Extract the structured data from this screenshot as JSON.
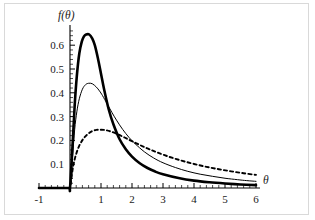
{
  "figure": {
    "background_color": "#ffffff",
    "border_color": "#d9d9d9",
    "axis_color": "#000000"
  },
  "axis_titles": {
    "y": "f(θ)",
    "x": "θ"
  },
  "chart_data": {
    "type": "line",
    "title": "",
    "subtitle": "",
    "xlabel": "θ",
    "ylabel": "f(θ)",
    "xlim": [
      -1,
      6
    ],
    "ylim": [
      0,
      0.66
    ],
    "grid": false,
    "legend": "none",
    "x_ticks": [
      -1,
      0,
      1,
      2,
      3,
      4,
      5,
      6
    ],
    "x_tick_labels": [
      "-1",
      "",
      "1",
      "2",
      "3",
      "4",
      "5",
      "6"
    ],
    "x_minor_tick_step": 0.2,
    "y_ticks": [
      0.1,
      0.2,
      0.3,
      0.4,
      0.5,
      0.6
    ],
    "y_tick_labels": [
      "0.1",
      "0.2",
      "0.3",
      "0.4",
      "0.5",
      "0.6"
    ],
    "y_minor_tick_step": 0.02,
    "annotations": [],
    "series": [
      {
        "name": "thick-solid-curve",
        "style": "solid",
        "line_width": 2.6,
        "color": "#000000",
        "peak": {
          "x": 0.62,
          "y": 0.645
        },
        "x": [
          -1.0,
          -0.5,
          -0.05,
          0.0,
          0.08,
          0.15,
          0.22,
          0.3,
          0.38,
          0.45,
          0.52,
          0.62,
          0.72,
          0.8,
          0.9,
          1.0,
          1.1,
          1.25,
          1.4,
          1.6,
          1.8,
          2.0,
          2.25,
          2.5,
          2.75,
          3.0,
          3.5,
          4.0,
          4.5,
          5.0,
          5.5,
          6.0
        ],
        "y": [
          0.0,
          0.0,
          0.0,
          0.0,
          0.175,
          0.345,
          0.47,
          0.565,
          0.615,
          0.637,
          0.645,
          0.645,
          0.628,
          0.6,
          0.545,
          0.48,
          0.415,
          0.33,
          0.268,
          0.205,
          0.163,
          0.132,
          0.104,
          0.084,
          0.069,
          0.058,
          0.042,
          0.031,
          0.024,
          0.019,
          0.015,
          0.012
        ]
      },
      {
        "name": "thin-solid-curve",
        "style": "solid",
        "line_width": 1.0,
        "color": "#000000",
        "peak": {
          "x": 0.72,
          "y": 0.44
        },
        "x": [
          -1.0,
          -0.5,
          -0.05,
          0.0,
          0.08,
          0.15,
          0.22,
          0.3,
          0.4,
          0.5,
          0.6,
          0.72,
          0.85,
          0.95,
          1.05,
          1.2,
          1.35,
          1.5,
          1.7,
          1.9,
          2.1,
          2.4,
          2.7,
          3.0,
          3.4,
          3.8,
          4.2,
          4.6,
          5.0,
          5.4,
          5.7,
          6.0
        ],
        "y": [
          0.0,
          0.0,
          0.0,
          0.0,
          0.128,
          0.245,
          0.32,
          0.375,
          0.415,
          0.434,
          0.44,
          0.438,
          0.424,
          0.408,
          0.388,
          0.353,
          0.318,
          0.285,
          0.246,
          0.213,
          0.186,
          0.152,
          0.126,
          0.106,
          0.086,
          0.07,
          0.058,
          0.049,
          0.041,
          0.035,
          0.031,
          0.028
        ]
      },
      {
        "name": "dashed-curve",
        "style": "dashed",
        "line_width": 1.9,
        "color": "#000000",
        "peak": {
          "x": 1.0,
          "y": 0.245
        },
        "x": [
          -1.0,
          -0.5,
          -0.05,
          0.0,
          0.1,
          0.2,
          0.3,
          0.42,
          0.55,
          0.7,
          0.85,
          1.0,
          1.15,
          1.3,
          1.5,
          1.7,
          1.9,
          2.2,
          2.5,
          2.8,
          3.2,
          3.6,
          4.0,
          4.4,
          4.8,
          5.2,
          5.6,
          6.0
        ],
        "y": [
          0.0,
          0.0,
          0.0,
          0.0,
          0.09,
          0.143,
          0.178,
          0.205,
          0.224,
          0.238,
          0.244,
          0.245,
          0.243,
          0.238,
          0.228,
          0.216,
          0.203,
          0.184,
          0.166,
          0.15,
          0.131,
          0.115,
          0.101,
          0.089,
          0.079,
          0.07,
          0.062,
          0.055
        ]
      }
    ]
  }
}
